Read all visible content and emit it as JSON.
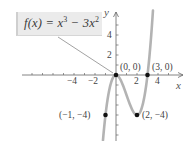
{
  "chart_data": {
    "type": "line",
    "title": "",
    "function_label": "f(x) = x³ − 3x²",
    "function_label_parts": {
      "lhs": "f(x) = x",
      "exp1": "3",
      "mid": " − 3x",
      "exp2": "2"
    },
    "xlabel": "x",
    "ylabel": "y",
    "x_ticks": [
      -4,
      -2,
      2,
      4
    ],
    "y_ticks": [
      2,
      4
    ],
    "xlim": [
      -5.5,
      6
    ],
    "ylim": [
      -6,
      6
    ],
    "grid": false,
    "series": [
      {
        "name": "f(x) = x^3 - 3x^2",
        "x": [
          -1.5,
          -1,
          -0.5,
          0,
          0.5,
          1,
          1.5,
          2,
          2.5,
          3,
          3.3,
          3.6
        ],
        "y": [
          -10.125,
          -4,
          -0.875,
          0,
          -0.625,
          -2,
          -3.375,
          -4,
          -3.125,
          0,
          2.967,
          7.776
        ]
      }
    ],
    "points": [
      {
        "x": 0,
        "y": 0,
        "label": "(0, 0)"
      },
      {
        "x": 3,
        "y": 0,
        "label": "(3, 0)"
      },
      {
        "x": -1,
        "y": -4,
        "label": "(−1, −4)"
      },
      {
        "x": 2,
        "y": -4,
        "label": "(2, −4)"
      }
    ]
  },
  "labels": {
    "function": "f(x) = x³ − 3x²",
    "x_axis": "x",
    "y_axis": "y",
    "tick_x_neg4": "−4",
    "tick_x_neg2": "−2",
    "tick_x_2": "2",
    "tick_x_4": "4",
    "tick_y_2": "2",
    "tick_y_4": "4",
    "pt_origin": "(0, 0)",
    "pt_3_0": "(3, 0)",
    "pt_neg1_neg4": "(−1, −4)",
    "pt_2_neg4": "(2, −4)"
  },
  "colors": {
    "curve": "#b3b3b3",
    "axis": "#666666",
    "point": "#111111",
    "label_box": "#ebebeb"
  }
}
